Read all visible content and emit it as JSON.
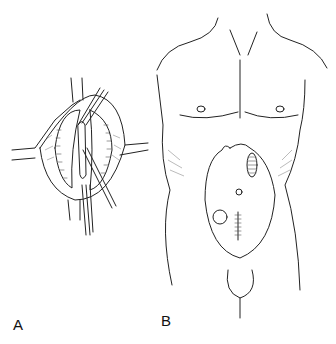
{
  "figure": {
    "panels": [
      {
        "label": "A",
        "subject": "surgical field with retractors and sutured incision"
      },
      {
        "label": "B",
        "subject": "male torso front view with abdominal stoma and incision sites"
      }
    ]
  },
  "colors": {
    "line": "#222222",
    "background": "#ffffff"
  }
}
